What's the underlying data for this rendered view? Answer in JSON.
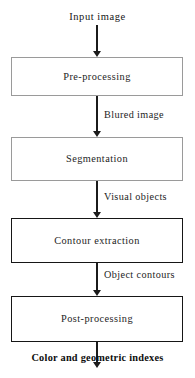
{
  "diagram": {
    "orientation": "top-to-bottom",
    "input_label": "Input image",
    "output_label": "Color and geometric indexes",
    "nodes": [
      {
        "id": "preprocessing",
        "label": "Pre-processing",
        "shape": "rectangle",
        "border": "#9a9a9a"
      },
      {
        "id": "segmentation",
        "label": "Segmentation",
        "shape": "rectangle",
        "border": "#9a9a9a"
      },
      {
        "id": "contour",
        "label": "Contour extraction",
        "shape": "rectangle",
        "border": "#161616"
      },
      {
        "id": "postprocessing",
        "label": "Post-processing",
        "shape": "rectangle",
        "border": "#161616"
      }
    ],
    "edges": [
      {
        "id": "e1",
        "from": "input",
        "to": "preprocessing",
        "label": ""
      },
      {
        "id": "e2",
        "from": "preprocessing",
        "to": "segmentation",
        "label": "Blured image"
      },
      {
        "id": "e3",
        "from": "segmentation",
        "to": "contour",
        "label": "Visual objects"
      },
      {
        "id": "e4",
        "from": "contour",
        "to": "postprocessing",
        "label": "Object contours"
      },
      {
        "id": "e5",
        "from": "postprocessing",
        "to": "output",
        "label": ""
      }
    ],
    "colors": {
      "background": "#ffffff",
      "text": "#1a1a1a",
      "arrow": "#1b1b1b",
      "border_light": "#9a9a9a",
      "border_dark": "#161616"
    }
  }
}
